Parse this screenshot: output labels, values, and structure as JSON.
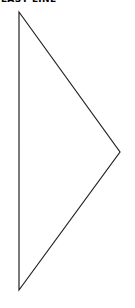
{
  "diagram": {
    "label": "LAST LINE",
    "shape": "triangle",
    "stroke_color": "#222222",
    "vertices": [
      [
        19,
        12
      ],
      [
        120,
        152
      ],
      [
        19,
        290
      ]
    ]
  }
}
